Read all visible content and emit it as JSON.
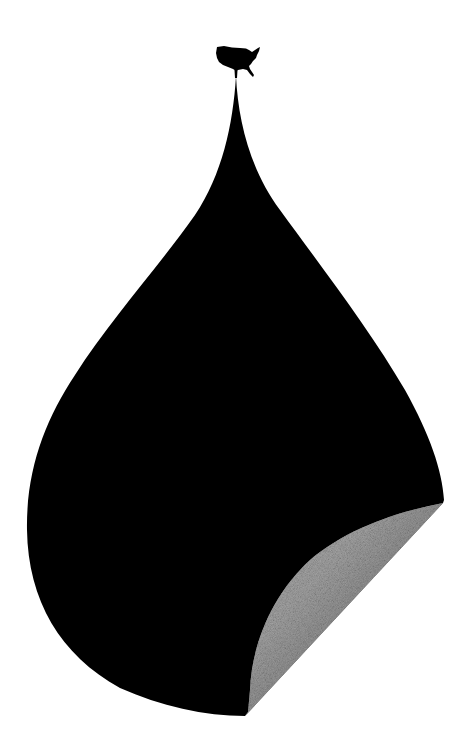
{
  "illustration": {
    "subject": "oil-drop-with-usa-map",
    "colors": {
      "background": "#ffffff",
      "drop": "#000000",
      "curl_light": "#a6a6a6",
      "curl_dark": "#4a4a4a"
    },
    "elements": [
      {
        "name": "usa-map-icon",
        "description": "silhouette of the contiguous United States at the tip of the drop"
      },
      {
        "name": "oil-drop",
        "description": "large black teardrop shape"
      },
      {
        "name": "peeling-corner",
        "description": "gray curled-up page corner at lower right"
      }
    ]
  }
}
